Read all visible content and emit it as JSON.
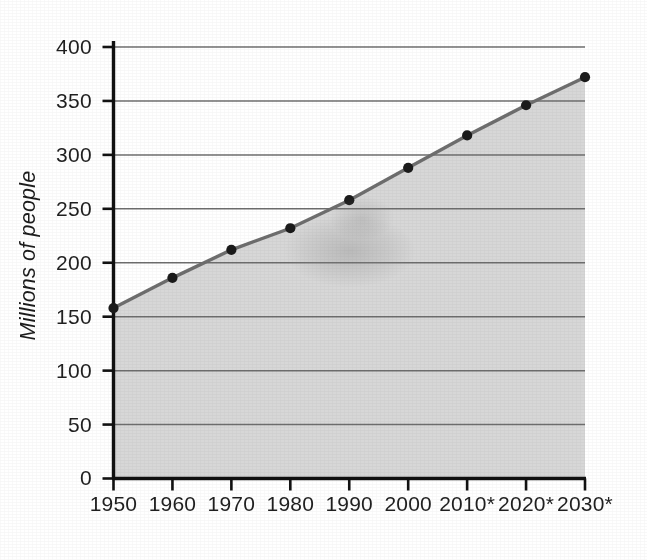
{
  "chart_data": {
    "type": "area",
    "title": "",
    "subtitle": "",
    "xlabel": "",
    "ylabel": "Millions of people",
    "categories": [
      "1950",
      "1960",
      "1970",
      "1980",
      "1990",
      "2000",
      "2010*",
      "2020*",
      "2030*"
    ],
    "x_values": [
      1950,
      1960,
      1970,
      1980,
      1990,
      2000,
      2010,
      2020,
      2030
    ],
    "values": [
      158,
      186,
      212,
      232,
      258,
      288,
      318,
      346,
      372
    ],
    "series": [
      {
        "name": "Millions of people",
        "values": [
          158,
          186,
          212,
          232,
          258,
          288,
          318,
          346,
          372
        ]
      }
    ],
    "ylim": [
      0,
      400
    ],
    "yticks": [
      0,
      50,
      100,
      150,
      200,
      250,
      300,
      350,
      400
    ],
    "ytick_labels": [
      "0",
      "50",
      "100",
      "150",
      "200",
      "250",
      "300",
      "350",
      "400"
    ],
    "grid": true,
    "grid_axis": "y",
    "legend": false,
    "legend_position": "none",
    "marker": "filled-circle",
    "annotations": [],
    "colors": {
      "fill": "#d7d7d7",
      "line": "#6e6e6e",
      "marker": "#1a1a1a",
      "grid": "#6f6f6f",
      "axis": "#111111",
      "text": "#1f1f1f",
      "background": "#ffffff"
    }
  },
  "axes": {
    "y_axis_label": "Millions of people",
    "x_axis_label": ""
  }
}
